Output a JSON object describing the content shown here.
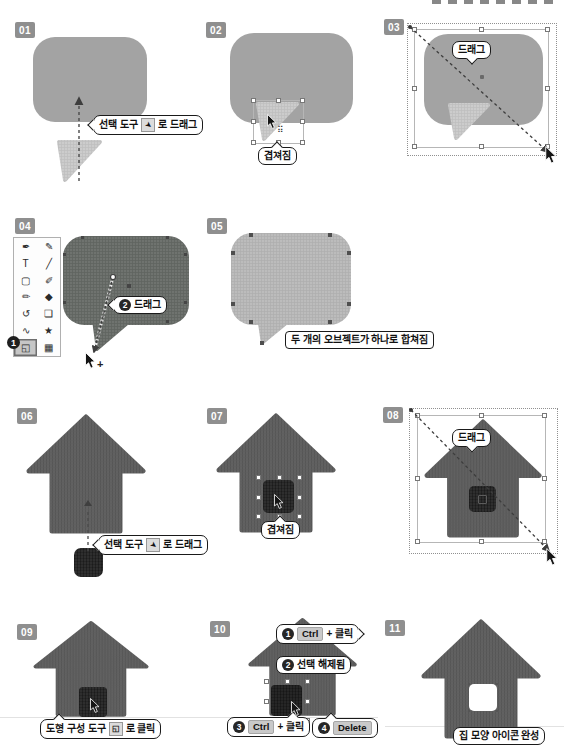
{
  "page": {
    "background": "#ffffff",
    "cropped_header_visible": true
  },
  "colors": {
    "step_badge_bg": "#8f8f8f",
    "bubble_gray": "#a3a3a3",
    "bubble_selected_dark": "#6f736f",
    "bubble_merged_light": "#bcbcbc",
    "house_gray": "#616161",
    "door_dark": "#2e2e2e",
    "callout_border": "#1a1a1a",
    "badge_circle": "#262626",
    "keycap_bg": "#c9c9c9"
  },
  "steps": [
    {
      "badge": "01",
      "callout_pre": "선택 도구",
      "callout_post": "로 드래그",
      "callout_icon": "selection-tool-icon"
    },
    {
      "badge": "02",
      "callout": "겹쳐짐"
    },
    {
      "badge": "03",
      "callout": "드래그"
    },
    {
      "badge": "04",
      "callout_num": "2",
      "callout_label": "드래그",
      "tool_badge": "1",
      "cursor_plus": "+"
    },
    {
      "badge": "05",
      "label": "두 개의 오브젝트가 하나로 합쳐짐"
    },
    {
      "badge": "06",
      "callout_pre": "선택 도구",
      "callout_post": "로 드래그",
      "callout_icon": "selection-tool-icon"
    },
    {
      "badge": "07",
      "callout": "겹쳐짐"
    },
    {
      "badge": "08",
      "callout": "드래그"
    },
    {
      "badge": "09",
      "callout_pre": "도형 구성 도구",
      "callout_post": "로 클릭",
      "callout_icon": "shape-builder-tool-icon"
    },
    {
      "badge": "10",
      "callouts": [
        {
          "num": "1",
          "key": "Ctrl",
          "suffix": "+ 클릭"
        },
        {
          "num": "2",
          "label": "선택 해제됨"
        },
        {
          "num": "3",
          "key": "Ctrl",
          "suffix": "+ 클릭"
        },
        {
          "num": "4",
          "key": "Delete"
        }
      ]
    },
    {
      "badge": "11",
      "label": "집 모양 아이콘 완성"
    }
  ],
  "toolbar": {
    "names": [
      [
        "pen-tool",
        "curvature-tool"
      ],
      [
        "type-tool",
        "line-tool"
      ],
      [
        "rectangle-tool",
        "paintbrush-tool"
      ],
      [
        "shaper-tool",
        "eraser-tool"
      ],
      [
        "rotate-tool",
        "free-transform-tool"
      ],
      [
        "width-tool",
        "puppet-warp-tool"
      ],
      [
        "shape-builder-tool",
        "perspective-grid-tool"
      ]
    ],
    "glyphs": [
      [
        "✒",
        "✎"
      ],
      [
        "T",
        "╱"
      ],
      [
        "▢",
        "✐"
      ],
      [
        "✏",
        "◆"
      ],
      [
        "↺",
        "❏"
      ],
      [
        "∿",
        "★"
      ],
      [
        "◱",
        "▦"
      ]
    ]
  }
}
